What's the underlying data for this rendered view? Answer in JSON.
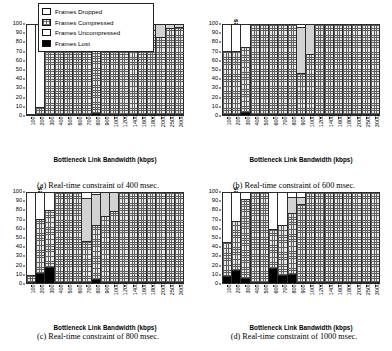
{
  "legend": {
    "items": [
      {
        "label": "Frames Dropped",
        "swatch": "white-square-icon",
        "color": "#ffffff"
      },
      {
        "label": "Frames Compressed",
        "swatch": "crosshatch-square-icon",
        "color": "#e8e8e8"
      },
      {
        "label": "Frames Uncompressed",
        "swatch": "light-gray-square-icon",
        "color": "#d2d2d2"
      },
      {
        "label": "Frames Lost",
        "swatch": "black-square-icon",
        "color": "#000000"
      }
    ]
  },
  "axis": {
    "ylabel": "Number of Frames",
    "xlabel": "Bottleneck Link Bandwidth (kbps)",
    "yticks": [
      0,
      10,
      20,
      30,
      40,
      50,
      60,
      70,
      80,
      90,
      100
    ],
    "ylim": [
      0,
      100
    ],
    "categories": [
      "100",
      "200",
      "300",
      "400",
      "500",
      "600",
      "700",
      "800",
      "900",
      "1000",
      "1200",
      "1400",
      "1600",
      "1800",
      "2000",
      "2500",
      "3000"
    ]
  },
  "captions": {
    "a": "(a)  Real-time constraint of 400 msec.",
    "b": "(b)  Real-time constraint of 600 msec.",
    "c": "(c)  Real-time constraint of 800 msec.",
    "d": "(d)  Real-time constraint of 1000 msec."
  },
  "chart_data": [
    {
      "type": "bar",
      "id": "panel-a",
      "title": "(a)  Real-time constraint of 400 msec.",
      "xlabel": "Bottleneck Link Bandwidth (kbps)",
      "ylabel": "Number of Frames",
      "ylim": [
        0,
        100
      ],
      "grid": false,
      "stacked": true,
      "legend_position": "above-figure",
      "categories": [
        "100",
        "200",
        "300",
        "400",
        "500",
        "600",
        "700",
        "800",
        "900",
        "1000",
        "1200",
        "1400",
        "1600",
        "1800",
        "2000",
        "2500",
        "3000"
      ],
      "series": [
        {
          "name": "Frames Lost",
          "values": [
            0,
            0,
            0,
            0,
            0,
            0,
            0,
            1,
            0,
            0,
            0,
            0,
            0,
            0,
            0,
            0,
            0
          ]
        },
        {
          "name": "Frames Compressed",
          "values": [
            0,
            8,
            92,
            94,
            100,
            100,
            100,
            99,
            100,
            100,
            100,
            71,
            85,
            93,
            86,
            96,
            97
          ]
        },
        {
          "name": "Frames Uncompressed",
          "values": [
            0,
            0,
            0,
            0,
            0,
            0,
            0,
            0,
            0,
            0,
            0,
            29,
            15,
            7,
            14,
            4,
            3
          ]
        },
        {
          "name": "Frames Dropped",
          "values": [
            100,
            92,
            8,
            6,
            0,
            0,
            0,
            0,
            0,
            0,
            0,
            0,
            0,
            0,
            0,
            0,
            0
          ]
        }
      ]
    },
    {
      "type": "bar",
      "id": "panel-b",
      "title": "(b)  Real-time constraint of 600 msec.",
      "xlabel": "Bottleneck Link Bandwidth (kbps)",
      "ylabel": "Number of Frames",
      "ylim": [
        0,
        100
      ],
      "grid": false,
      "stacked": true,
      "legend_position": "above-figure",
      "categories": [
        "100",
        "200",
        "300",
        "400",
        "500",
        "600",
        "700",
        "800",
        "900",
        "1000",
        "1200",
        "1400",
        "1600",
        "1800",
        "2000",
        "2500",
        "3000"
      ],
      "series": [
        {
          "name": "Frames Lost",
          "values": [
            0,
            0,
            2,
            0,
            0,
            0,
            0,
            0,
            0,
            0,
            0,
            0,
            0,
            0,
            0,
            0,
            0
          ]
        },
        {
          "name": "Frames Compressed",
          "values": [
            70,
            70,
            73,
            100,
            100,
            100,
            100,
            100,
            46,
            67,
            100,
            100,
            100,
            100,
            100,
            100,
            100
          ]
        },
        {
          "name": "Frames Uncompressed",
          "values": [
            0,
            0,
            0,
            0,
            0,
            0,
            0,
            0,
            51,
            33,
            0,
            0,
            0,
            0,
            0,
            0,
            0
          ]
        },
        {
          "name": "Frames Dropped",
          "values": [
            30,
            30,
            25,
            0,
            0,
            0,
            0,
            0,
            3,
            0,
            0,
            0,
            0,
            0,
            0,
            0,
            0
          ]
        }
      ]
    },
    {
      "type": "bar",
      "id": "panel-c",
      "title": "(c)  Real-time constraint of 800 msec.",
      "xlabel": "Bottleneck Link Bandwidth (kbps)",
      "ylabel": "Number of Frames",
      "ylim": [
        0,
        100
      ],
      "grid": false,
      "stacked": true,
      "legend_position": "above-figure",
      "categories": [
        "100",
        "200",
        "300",
        "400",
        "500",
        "600",
        "700",
        "800",
        "900",
        "1000",
        "1200",
        "1400",
        "1600",
        "1800",
        "2000",
        "2500",
        "3000"
      ],
      "series": [
        {
          "name": "Frames Lost",
          "values": [
            0,
            10,
            17,
            0,
            0,
            0,
            0,
            3,
            0,
            0,
            0,
            0,
            0,
            0,
            0,
            0,
            0
          ]
        },
        {
          "name": "Frames Compressed",
          "values": [
            8,
            60,
            63,
            100,
            100,
            100,
            46,
            60,
            73,
            79,
            100,
            100,
            100,
            100,
            100,
            100,
            100
          ]
        },
        {
          "name": "Frames Uncompressed",
          "values": [
            0,
            0,
            0,
            0,
            0,
            0,
            47,
            35,
            27,
            21,
            0,
            0,
            0,
            0,
            0,
            0,
            0
          ]
        },
        {
          "name": "Frames Dropped",
          "values": [
            92,
            30,
            20,
            0,
            0,
            0,
            7,
            2,
            0,
            0,
            0,
            0,
            0,
            0,
            0,
            0,
            0
          ]
        }
      ]
    },
    {
      "type": "bar",
      "id": "panel-d",
      "title": "(d)  Real-time constraint of 1000 msec.",
      "xlabel": "Bottleneck Link Bandwidth (kbps)",
      "ylabel": "Number of Frames",
      "ylim": [
        0,
        100
      ],
      "grid": false,
      "stacked": true,
      "legend_position": "above-figure",
      "categories": [
        "100",
        "200",
        "300",
        "400",
        "500",
        "600",
        "700",
        "800",
        "900",
        "1000",
        "1200",
        "1400",
        "1600",
        "1800",
        "2000",
        "2500",
        "3000"
      ],
      "series": [
        {
          "name": "Frames Lost",
          "values": [
            7,
            13,
            4,
            0,
            0,
            16,
            8,
            9,
            0,
            0,
            0,
            0,
            0,
            0,
            0,
            0,
            0
          ]
        },
        {
          "name": "Frames Compressed",
          "values": [
            38,
            55,
            88,
            100,
            100,
            43,
            55,
            68,
            87,
            100,
            100,
            100,
            100,
            100,
            100,
            100,
            100
          ]
        },
        {
          "name": "Frames Uncompressed",
          "values": [
            0,
            0,
            0,
            0,
            0,
            0,
            0,
            18,
            8,
            0,
            0,
            0,
            0,
            0,
            0,
            0,
            0
          ]
        },
        {
          "name": "Frames Dropped",
          "values": [
            55,
            32,
            8,
            0,
            0,
            41,
            37,
            5,
            5,
            0,
            0,
            0,
            0,
            0,
            0,
            0,
            0
          ]
        }
      ]
    }
  ]
}
